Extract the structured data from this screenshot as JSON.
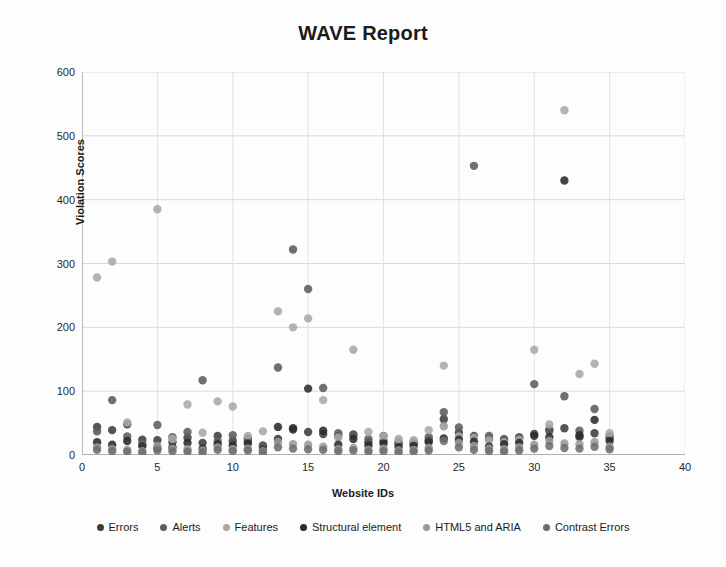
{
  "chart_data": {
    "type": "scatter",
    "title": "WAVE Report",
    "xlabel": "Website IDs",
    "ylabel": "Violation Scores",
    "xlim": [
      0,
      40
    ],
    "ylim": [
      0,
      600
    ],
    "xticks": [
      0,
      5,
      10,
      15,
      20,
      25,
      30,
      35,
      40
    ],
    "yticks": [
      0,
      100,
      200,
      300,
      400,
      500,
      600
    ],
    "grid": true,
    "legend_position": "bottom",
    "x": [
      1,
      2,
      3,
      4,
      5,
      6,
      7,
      8,
      9,
      10,
      11,
      12,
      13,
      14,
      15,
      16,
      17,
      18,
      19,
      20,
      21,
      22,
      23,
      24,
      25,
      26,
      27,
      28,
      29,
      30,
      31,
      32,
      33,
      34,
      35
    ],
    "series": [
      {
        "name": "Errors",
        "color": "#3d3d3d",
        "values": [
          44,
          39,
          48,
          24,
          23,
          20,
          27,
          19,
          30,
          22,
          26,
          14,
          25,
          40,
          36,
          33,
          30,
          32,
          20,
          22,
          17,
          18,
          23,
          56,
          35,
          30,
          25,
          23,
          27,
          33,
          38,
          42,
          28,
          34,
          26
        ]
      },
      {
        "name": "Alerts",
        "color": "#5c5c5c",
        "values": [
          37,
          86,
          29,
          18,
          47,
          28,
          36,
          117,
          22,
          31,
          21,
          15,
          137,
          322,
          260,
          105,
          34,
          30,
          25,
          30,
          20,
          20,
          28,
          67,
          43,
          453,
          30,
          25,
          28,
          111,
          40,
          92,
          38,
          72,
          30
        ]
      },
      {
        "name": "Features",
        "color": "#a8a8a8",
        "values": [
          278,
          303,
          51,
          15,
          385,
          25,
          79,
          35,
          84,
          76,
          30,
          37,
          225,
          200,
          214,
          86,
          27,
          165,
          36,
          29,
          25,
          23,
          39,
          140,
          29,
          27,
          23,
          20,
          24,
          165,
          48,
          540,
          127,
          143,
          34
        ]
      },
      {
        "name": "Structural element",
        "color": "#2b2b2b",
        "values": [
          20,
          16,
          22,
          14,
          11,
          12,
          19,
          10,
          17,
          15,
          18,
          8,
          44,
          42,
          104,
          38,
          16,
          25,
          15,
          18,
          12,
          14,
          20,
          26,
          24,
          21,
          13,
          17,
          19,
          30,
          28,
          430,
          31,
          55,
          22
        ]
      },
      {
        "name": "HTML5 and ARIA",
        "color": "#9a9a9a",
        "values": [
          12,
          9,
          8,
          6,
          14,
          10,
          9,
          7,
          12,
          9,
          10,
          6,
          20,
          17,
          16,
          13,
          9,
          11,
          8,
          10,
          7,
          8,
          11,
          45,
          19,
          14,
          10,
          9,
          12,
          16,
          22,
          18,
          17,
          20,
          13
        ]
      },
      {
        "name": "Contrast Errors",
        "color": "#6e6e6e",
        "values": [
          8,
          6,
          5,
          4,
          7,
          6,
          5,
          4,
          8,
          6,
          7,
          4,
          12,
          10,
          9,
          8,
          6,
          7,
          5,
          6,
          4,
          5,
          7,
          22,
          12,
          8,
          6,
          5,
          7,
          10,
          14,
          11,
          10,
          13,
          9
        ]
      }
    ]
  }
}
